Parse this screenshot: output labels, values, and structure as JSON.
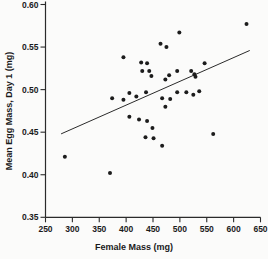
{
  "figure": {
    "background": "#fbfbfa",
    "point_color": "#1c1c1c",
    "axis_color": "#2b2b2b",
    "text_color": "#1a1a1a",
    "trendline_color": "#2b2b2b"
  },
  "chart_data": {
    "type": "scatter",
    "title": "",
    "xlabel": "Female Mass (mg)",
    "ylabel": "Mean Egg Mass, Day 1 (mg)",
    "xlim": [
      250,
      650
    ],
    "ylim": [
      0.35,
      0.6
    ],
    "x_ticks": [
      250,
      300,
      350,
      400,
      450,
      500,
      550,
      600,
      650
    ],
    "y_ticks": [
      0.35,
      0.4,
      0.45,
      0.5,
      0.55,
      0.6
    ],
    "y_tick_labels": [
      "0.35",
      "0.40",
      "0.45",
      "0.50",
      "0.55",
      "0.60"
    ],
    "grid": false,
    "legend": null,
    "marker": "filled-circle",
    "points": [
      [
        286,
        0.421
      ],
      [
        370,
        0.402
      ],
      [
        374,
        0.49
      ],
      [
        395,
        0.538
      ],
      [
        395,
        0.488
      ],
      [
        406,
        0.496
      ],
      [
        406,
        0.468
      ],
      [
        419,
        0.492
      ],
      [
        424,
        0.465
      ],
      [
        428,
        0.532
      ],
      [
        430,
        0.522
      ],
      [
        436,
        0.444
      ],
      [
        437,
        0.497
      ],
      [
        439,
        0.531
      ],
      [
        439,
        0.463
      ],
      [
        443,
        0.522
      ],
      [
        447,
        0.516
      ],
      [
        449,
        0.455
      ],
      [
        451,
        0.443
      ],
      [
        464,
        0.554
      ],
      [
        467,
        0.49
      ],
      [
        467,
        0.434
      ],
      [
        473,
        0.512
      ],
      [
        473,
        0.48
      ],
      [
        475,
        0.55
      ],
      [
        480,
        0.517
      ],
      [
        482,
        0.489
      ],
      [
        495,
        0.522
      ],
      [
        495,
        0.497
      ],
      [
        499,
        0.567
      ],
      [
        512,
        0.497
      ],
      [
        521,
        0.522
      ],
      [
        525,
        0.494
      ],
      [
        527,
        0.518
      ],
      [
        529,
        0.515
      ],
      [
        536,
        0.498
      ],
      [
        546,
        0.531
      ],
      [
        562,
        0.448
      ],
      [
        624,
        0.577
      ]
    ],
    "trendline": {
      "x1": 279,
      "y1": 0.448,
      "x2": 630,
      "y2": 0.546
    }
  }
}
